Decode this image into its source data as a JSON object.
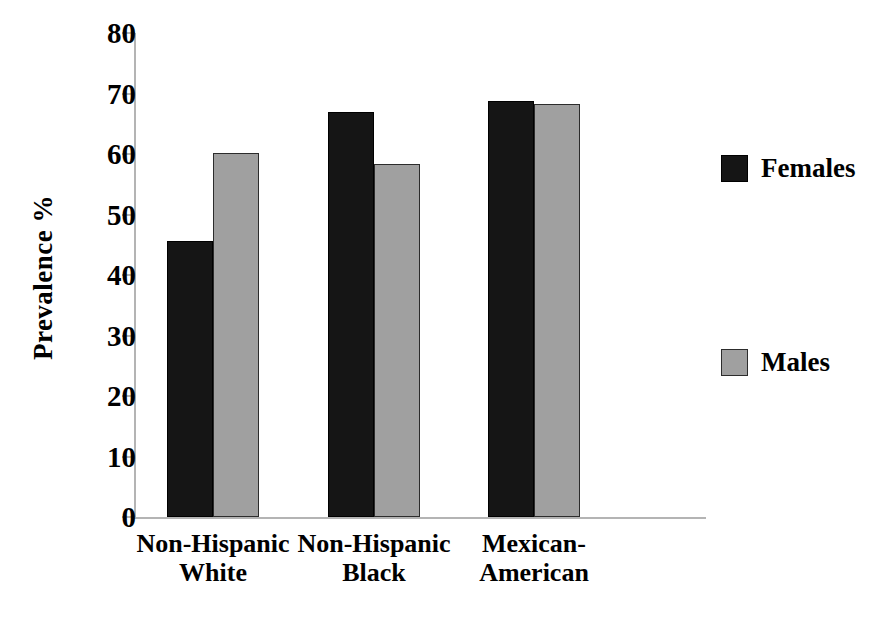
{
  "chart_data": {
    "type": "bar",
    "title": "",
    "xlabel": "",
    "ylabel": "Prevalence %",
    "ylim": [
      0,
      80
    ],
    "ytick_step": 10,
    "yticks": [
      80,
      70,
      60,
      50,
      40,
      30,
      20,
      10,
      0
    ],
    "grid": false,
    "legend_position": "right",
    "categories": [
      "Non-Hispanic White",
      "Non-Hispanic Black",
      "Mexican-American"
    ],
    "category_lines": [
      [
        "Non-Hispanic",
        "White"
      ],
      [
        "Non-Hispanic",
        "Black"
      ],
      [
        "Mexican-",
        "American"
      ]
    ],
    "series": [
      {
        "name": "Females",
        "color": "#151515",
        "values": [
          45.7,
          67.0,
          68.8
        ]
      },
      {
        "name": "Males",
        "color": "#a0a0a0",
        "values": [
          60.2,
          58.3,
          68.3
        ]
      }
    ]
  },
  "axis": {
    "y_title": "Prevalence %",
    "tick_labels": [
      "80",
      "70",
      "60",
      "50",
      "40",
      "30",
      "20",
      "10",
      "0"
    ]
  },
  "legend": {
    "items": [
      {
        "label": "Females",
        "swatch": "black-square-swatch"
      },
      {
        "label": "Males",
        "swatch": "gray-square-swatch"
      }
    ]
  }
}
